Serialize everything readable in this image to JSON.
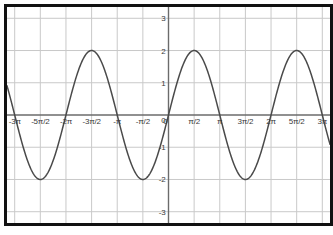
{
  "chart_data": {
    "type": "line",
    "title": "",
    "subtitle": "",
    "xlabel": "",
    "ylabel": "",
    "function": "y = 2 sin(x)",
    "amplitude": 2,
    "period": "2π",
    "xlim": [
      -9.896,
      9.896
    ],
    "ylim": [
      -3.35,
      3.35
    ],
    "grid": true,
    "legend": false,
    "legend_position": "none",
    "x_tick_labels": [
      "-3π",
      "-5π/2",
      "-2π",
      "-3π/2",
      "-π",
      "-π/2",
      "0",
      "π/2",
      "π",
      "3π/2",
      "2π",
      "5π/2",
      "3π"
    ],
    "x_tick_values": [
      -9.4248,
      -7.854,
      -6.2832,
      -4.7124,
      -3.1416,
      -1.5708,
      0,
      1.5708,
      3.1416,
      4.7124,
      6.2832,
      7.854,
      9.4248
    ],
    "y_tick_labels": [
      "3",
      "2",
      "1",
      "0",
      "-1",
      "-2",
      "-3"
    ],
    "y_tick_values": [
      3,
      2,
      1,
      0,
      -1,
      -2,
      -3
    ],
    "series": [
      {
        "name": "y = 2 sin(x)",
        "color": "#4a4a4a",
        "x": [
          -9.4248,
          -9.1106,
          -8.7965,
          -8.4823,
          -8.1681,
          -7.854,
          -7.5398,
          -7.2257,
          -6.9115,
          -6.5973,
          -6.2832,
          -5.969,
          -5.6549,
          -5.3407,
          -5.0265,
          -4.7124,
          -4.3982,
          -4.0841,
          -3.7699,
          -3.4558,
          -3.1416,
          -2.8274,
          -2.5133,
          -2.1991,
          -1.885,
          -1.5708,
          -1.2566,
          -0.9425,
          -0.6283,
          -0.3142,
          0,
          0.3142,
          0.6283,
          0.9425,
          1.2566,
          1.5708,
          1.885,
          2.1991,
          2.5133,
          2.8274,
          3.1416,
          3.4558,
          3.7699,
          4.0841,
          4.3982,
          4.7124,
          5.0265,
          5.3407,
          5.6549,
          5.969,
          6.2832,
          6.5973,
          6.9115,
          7.2257,
          7.5398,
          7.854,
          8.1681,
          8.4823,
          8.7965,
          9.1106,
          9.4248
        ],
        "y": [
          0,
          -0.618,
          -1.176,
          -1.618,
          -1.902,
          -2,
          -1.902,
          -1.618,
          -1.176,
          -0.618,
          0,
          0.618,
          1.176,
          1.618,
          1.902,
          2,
          1.902,
          1.618,
          1.176,
          0.618,
          0,
          -0.618,
          -1.176,
          -1.618,
          -1.902,
          -2,
          -1.902,
          -1.618,
          -1.176,
          -0.618,
          0,
          0.618,
          1.176,
          1.618,
          1.902,
          2,
          1.902,
          1.618,
          1.176,
          0.618,
          0,
          -0.618,
          -1.176,
          -1.618,
          -1.902,
          -2,
          -1.902,
          -1.618,
          -1.176,
          -0.618,
          0,
          0.618,
          1.176,
          1.618,
          1.902,
          2,
          1.902,
          1.618,
          1.176,
          0.618,
          0
        ]
      }
    ],
    "maxima": [
      {
        "x": "-5π/2",
        "y": 2
      },
      {
        "x": "-π/2",
        "y": 2
      },
      {
        "x": "3π/2",
        "y": 2
      },
      {
        "x": "7π/2",
        "y": 2
      }
    ],
    "minima": [
      {
        "x": "-7π/2",
        "y": -2
      },
      {
        "x": "-3π/2",
        "y": -2
      },
      {
        "x": "π/2",
        "y": -2
      }
    ],
    "colors": {
      "curve": "#4a4a4a",
      "grid": "#c9c9c9",
      "axis": "#6b6b6b",
      "border": "#111111",
      "background": "#ffffff",
      "tick_text": "#3a3a3a"
    }
  }
}
